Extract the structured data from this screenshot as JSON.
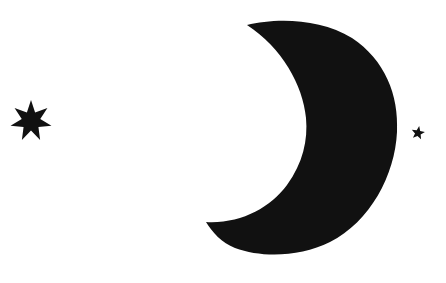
{
  "scene": {
    "title": "Crescent moon with stars",
    "background_color": "#ffffff",
    "fill_color": "#111111",
    "elements": {
      "moon": {
        "icon": "crescent-moon-icon",
        "description": "Large black crescent moon opening to the left"
      },
      "star_large": {
        "icon": "seven-point-star-icon",
        "description": "Seven-pointed black star on the left",
        "points": 7,
        "cx": 31,
        "cy": 121,
        "outer_r": 21,
        "inner_r": 9.5
      },
      "star_small": {
        "icon": "five-point-star-icon",
        "description": "Small five-pointed black star on the right",
        "points": 5,
        "cx": 418,
        "cy": 133,
        "outer_r": 7,
        "inner_r": 3
      }
    }
  }
}
